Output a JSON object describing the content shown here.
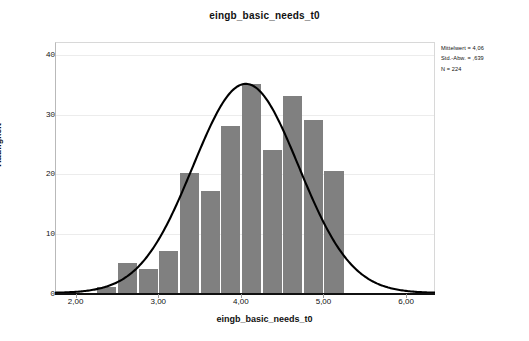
{
  "chart_data": {
    "type": "bar",
    "title": "eingb_basic_needs_t0",
    "xlabel": "eingb_basic_needs_t0",
    "ylabel": "Häufigkeit",
    "xlim": [
      1.75,
      6.35
    ],
    "ylim": [
      0,
      42
    ],
    "grid": true,
    "legend": "none",
    "bin_width": 0.25,
    "xtick_labels": [
      "2,00",
      "3,00",
      "4,00",
      "5,00",
      "6,00"
    ],
    "xtick_values": [
      2.0,
      3.0,
      4.0,
      5.0,
      6.0
    ],
    "ytick_labels": [
      "0",
      "10",
      "20",
      "30",
      "40"
    ],
    "ytick_values": [
      0,
      10,
      20,
      30,
      40
    ],
    "categories": [
      "2,25",
      "2,50",
      "2,75",
      "3,00",
      "3,25",
      "3,50",
      "3,75",
      "4,00",
      "4,25",
      "4,50",
      "4,75",
      "5,00"
    ],
    "bin_starts": [
      2.25,
      2.5,
      2.75,
      3.0,
      3.25,
      3.5,
      3.75,
      4.0,
      4.25,
      4.5,
      4.75,
      5.0
    ],
    "values": [
      1,
      5,
      4,
      7,
      20,
      17,
      28,
      35,
      24,
      33,
      29,
      20.5
    ],
    "bar_color": "#808080",
    "curve": {
      "name": "Normalverteilung",
      "color": "#000000",
      "mean": 4.06,
      "sd": 0.639,
      "peak_value": 35
    }
  },
  "stats": {
    "mean_line": "Mittelwert = 4,06",
    "sd_line": "Std.-Abw. = ,639",
    "n_line": "N = 224"
  }
}
